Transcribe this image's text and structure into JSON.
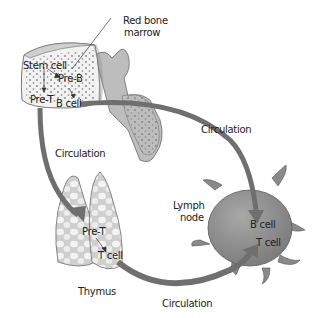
{
  "diagram": {
    "labels": {
      "red_bone_marrow_line1": "Red bone",
      "red_bone_marrow_line2": "marrow",
      "stem_cell": "Stem cell",
      "pre_b": "Pre-B",
      "pre_t_marrow": "Pre-T",
      "b_cell_marrow": "B cell",
      "circulation_top": "Circulation",
      "circulation_left": "Circulation",
      "circulation_bottom": "Circulation",
      "pre_t_thymus": "Pre-T",
      "t_cell_thymus": "T cell",
      "thymus": "Thymus",
      "lymph_node_line1": "Lymph",
      "lymph_node_line2": "node",
      "b_cell_node": "B cell",
      "t_cell_node": "T cell"
    },
    "organs": [
      "red bone marrow",
      "thymus",
      "lymph node"
    ],
    "flows": [
      {
        "from": "Stem cell",
        "to": "Pre-B"
      },
      {
        "from": "Stem cell",
        "to": "Pre-T"
      },
      {
        "from": "Pre-B",
        "to": "B cell"
      },
      {
        "from": "B cell (marrow)",
        "to": "B cell (lymph node)",
        "via": "Circulation"
      },
      {
        "from": "Pre-T (marrow)",
        "to": "Pre-T (thymus)",
        "via": "Circulation"
      },
      {
        "from": "Pre-T (thymus)",
        "to": "T cell (thymus)"
      },
      {
        "from": "T cell (thymus)",
        "to": "T cell (lymph node)",
        "via": "Circulation"
      }
    ],
    "colors": {
      "arrow": "#6f6f6f",
      "organ_fill": "#c9c9c9",
      "lymph_node_fill": "#8e8e8e",
      "marrow_fill": "#f2f2f2",
      "dots": "#8a8a8a"
    }
  }
}
